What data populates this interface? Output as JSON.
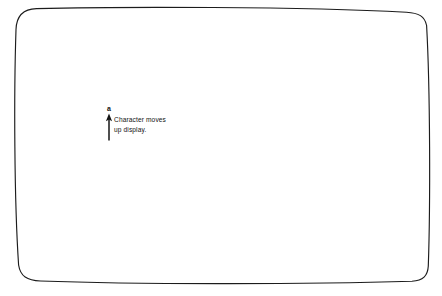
{
  "figure": {
    "name": "terminal-display-scroll-illustration",
    "background_color": "#ffffff",
    "stroke_color": "#1c1c1c",
    "text_color": "#121212"
  },
  "screen": {
    "label": "crt-display-outline",
    "shape": "rounded-rectangle-barrel",
    "bounds": {
      "left": 13,
      "top": 8,
      "right": 429,
      "bottom": 283
    },
    "corner_radius": 22
  },
  "annotation": {
    "character": "a",
    "arrow_direction": "up",
    "caption_lines": [
      "Character moves",
      "up display."
    ],
    "caption_line_1": "Character moves",
    "caption_line_2": "up display.",
    "position": {
      "x": 103,
      "y": 107
    }
  }
}
